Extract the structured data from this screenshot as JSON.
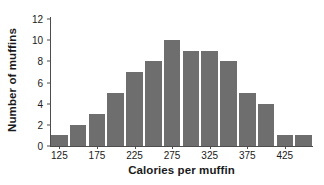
{
  "chart_data": {
    "type": "bar",
    "title": "",
    "xlabel": "Calories per muffin",
    "ylabel": "Number of muffins",
    "categories": [
      "125",
      "150",
      "175",
      "200",
      "225",
      "250",
      "275",
      "300",
      "325",
      "350",
      "375",
      "400",
      "425",
      "450"
    ],
    "values": [
      1,
      2,
      3,
      5,
      7,
      8,
      10,
      9,
      9,
      8,
      5,
      4,
      1,
      1
    ],
    "xlim": [
      112.5,
      462.5
    ],
    "ylim": [
      0,
      12
    ],
    "y_ticks": [
      0,
      2,
      4,
      6,
      8,
      10,
      12
    ],
    "y_tick_labels": [
      "0",
      "2",
      "4",
      "6",
      "8",
      "10",
      "12"
    ],
    "x_ticks": [
      125,
      175,
      225,
      275,
      325,
      375,
      425
    ],
    "x_tick_labels": [
      "125",
      "175",
      "225",
      "275",
      "325",
      "375",
      "425"
    ],
    "bin_width": 25,
    "grid": false,
    "legend": false,
    "bar_color": "#6e6e6e",
    "axis_color": "#4d4d4d",
    "text_color": "#1a1a1a",
    "background": "#ffffff"
  }
}
